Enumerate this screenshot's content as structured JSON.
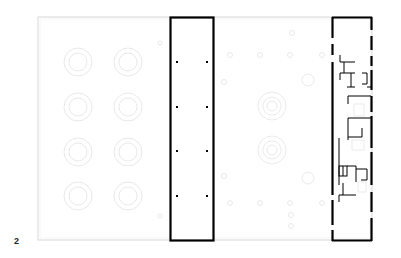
{
  "figure": {
    "label": "2",
    "type": "architectural floor plan",
    "colors": {
      "wall": "#000000",
      "faint_outline": "#d8d8d8",
      "faint_fixture": "#e4e4e4",
      "background": "#ffffff"
    }
  },
  "plan": {
    "site_outline": {
      "x": 38,
      "y": 17,
      "w": 334,
      "h": 223
    },
    "left_open_area": {
      "circles": [
        {
          "cx": 78,
          "cy": 62
        },
        {
          "cx": 128,
          "cy": 62
        },
        {
          "cx": 78,
          "cy": 107
        },
        {
          "cx": 128,
          "cy": 107
        },
        {
          "cx": 78,
          "cy": 152
        },
        {
          "cx": 128,
          "cy": 152
        },
        {
          "cx": 78,
          "cy": 196
        },
        {
          "cx": 128,
          "cy": 196
        }
      ]
    },
    "center_building": {
      "x": 170,
      "y": 17,
      "w": 44,
      "h": 224,
      "columns": [
        {
          "x": 177,
          "y": 62
        },
        {
          "x": 207,
          "y": 62
        },
        {
          "x": 177,
          "y": 107
        },
        {
          "x": 207,
          "y": 107
        },
        {
          "x": 177,
          "y": 151
        },
        {
          "x": 207,
          "y": 151
        },
        {
          "x": 177,
          "y": 196
        },
        {
          "x": 207,
          "y": 196
        }
      ]
    },
    "middle_open_area": {
      "circles": [
        {
          "cx": 272,
          "cy": 106
        },
        {
          "cx": 272,
          "cy": 150
        }
      ]
    },
    "right_building": {
      "x": 332,
      "y": 17,
      "w": 40,
      "h": 224
    }
  }
}
